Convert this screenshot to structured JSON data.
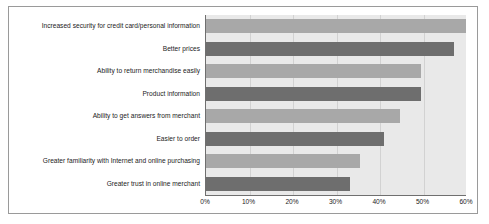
{
  "chart_data": {
    "type": "bar",
    "orientation": "horizontal",
    "title": "",
    "xlabel": "",
    "ylabel": "",
    "xlim": [
      0,
      60
    ],
    "grid": true,
    "legend": "none",
    "tick_labels": [
      "0%",
      "10%",
      "20%",
      "30%",
      "40%",
      "50%",
      "60%"
    ],
    "tick_values": [
      0,
      10,
      20,
      30,
      40,
      50,
      60
    ],
    "categories": [
      "Increased security for credit card/personal information",
      "Better prices",
      "Ability to return merchandise easily",
      "Product information",
      "Ability to get answers from merchant",
      "Easier to order",
      "Greater familiarity with Internet and online purchasing",
      "Greater trust in online merchant"
    ],
    "values": [
      60,
      57,
      49.5,
      49.5,
      44.5,
      41,
      35.5,
      33
    ],
    "bar_shades": [
      "light",
      "dark",
      "light",
      "dark",
      "light",
      "dark",
      "light",
      "dark"
    ],
    "colors": {
      "bar_light": "#a8a8a8",
      "bar_dark": "#6e6e6e",
      "plot_background": "#e9e9e9",
      "gridline": "#d2d2d2",
      "axis": "#6f6f6f",
      "text": "#1b1b1b",
      "frame_border": "#9a9a9a"
    }
  }
}
